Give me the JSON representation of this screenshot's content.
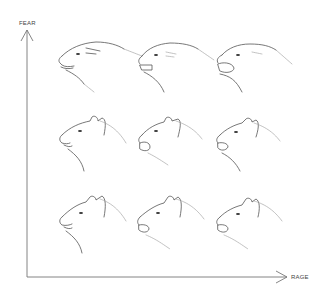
{
  "diagram": {
    "y_axis": {
      "label": "FEAR",
      "direction": "up"
    },
    "x_axis": {
      "label": "RAGE",
      "direction": "right"
    },
    "grid": {
      "rows": 3,
      "cols": 3
    },
    "heads": [
      {
        "row": 0,
        "col": 0,
        "fear": "high",
        "rage": "low",
        "ears": "flattened",
        "mouth": "slightly-open"
      },
      {
        "row": 0,
        "col": 1,
        "fear": "high",
        "rage": "mid",
        "ears": "flattened",
        "mouth": "open-teeth"
      },
      {
        "row": 0,
        "col": 2,
        "fear": "high",
        "rage": "high",
        "ears": "flattened",
        "mouth": "snarl-wide"
      },
      {
        "row": 1,
        "col": 0,
        "fear": "mid",
        "rage": "low",
        "ears": "half-back",
        "mouth": "slightly-open"
      },
      {
        "row": 1,
        "col": 1,
        "fear": "mid",
        "rage": "mid",
        "ears": "half-back",
        "mouth": "open-teeth"
      },
      {
        "row": 1,
        "col": 2,
        "fear": "mid",
        "rage": "high",
        "ears": "half-back",
        "mouth": "snarl-wide"
      },
      {
        "row": 2,
        "col": 0,
        "fear": "low",
        "rage": "low",
        "ears": "upright",
        "mouth": "closed"
      },
      {
        "row": 2,
        "col": 1,
        "fear": "low",
        "rage": "mid",
        "ears": "upright",
        "mouth": "open-teeth"
      },
      {
        "row": 2,
        "col": 2,
        "fear": "low",
        "rage": "high",
        "ears": "upright",
        "mouth": "snarl-wide"
      }
    ]
  }
}
